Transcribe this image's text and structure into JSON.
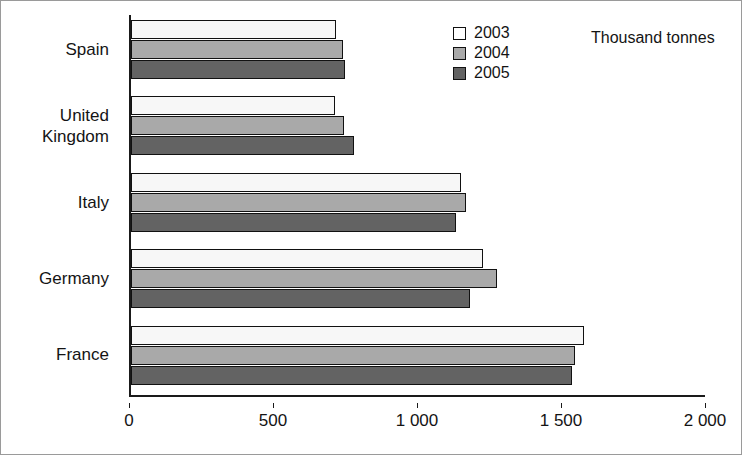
{
  "chart_data": {
    "type": "bar",
    "orientation": "horizontal",
    "title": "",
    "subtitle": "",
    "unit_note": "Thousand tonnes",
    "xlabel": "",
    "ylabel": "",
    "xlim": [
      0,
      2000
    ],
    "xticks": [
      0,
      500,
      1000,
      1500,
      2000
    ],
    "xtick_labels": [
      "0",
      "500",
      "1 000",
      "1 500",
      "2 000"
    ],
    "grid": false,
    "legend_position": "top-center",
    "categories": [
      "Spain",
      "United Kingdom",
      "Italy",
      "Germany",
      "France"
    ],
    "series": [
      {
        "name": "2003",
        "color": "#f7f7f7",
        "values": [
          712,
          708,
          1146,
          1222,
          1573
        ]
      },
      {
        "name": "2004",
        "color": "#a9a9a9",
        "values": [
          736,
          740,
          1163,
          1271,
          1542
        ]
      },
      {
        "name": "2005",
        "color": "#636363",
        "values": [
          743,
          774,
          1128,
          1177,
          1531
        ]
      }
    ]
  },
  "legend": {
    "items": [
      {
        "label": "2003"
      },
      {
        "label": "2004"
      },
      {
        "label": "2005"
      }
    ]
  },
  "colors": {
    "series_2003": "#f7f7f7",
    "series_2004": "#a9a9a9",
    "series_2005": "#636363",
    "axis": "#1a1a1a",
    "text": "#141414",
    "frame": "#9a9a9a"
  }
}
